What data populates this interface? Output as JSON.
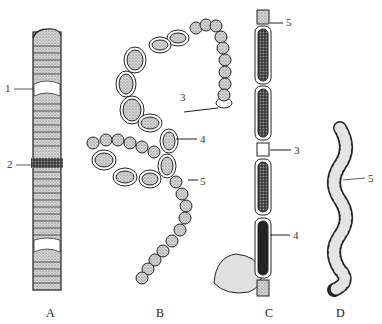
{
  "figure": {
    "panels": [
      {
        "id": "A",
        "caption": "A"
      },
      {
        "id": "B",
        "caption": "B"
      },
      {
        "id": "C",
        "caption": "C"
      },
      {
        "id": "D",
        "caption": "D"
      }
    ],
    "callouts": [
      {
        "panel": "A",
        "number": "1"
      },
      {
        "panel": "A",
        "number": "2"
      },
      {
        "panel": "B",
        "number": "3"
      },
      {
        "panel": "B",
        "number": "4"
      },
      {
        "panel": "B",
        "number": "5"
      },
      {
        "panel": "C",
        "number": "5"
      },
      {
        "panel": "C",
        "number": "3"
      },
      {
        "panel": "C",
        "number": "4"
      },
      {
        "panel": "D",
        "number": "5"
      }
    ]
  }
}
